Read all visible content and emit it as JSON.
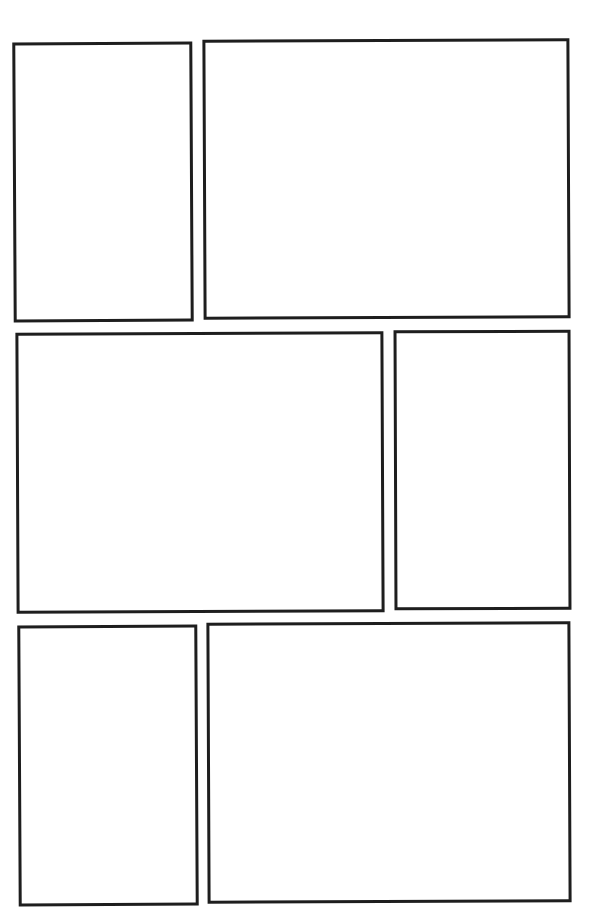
{
  "page": {
    "type": "comic-page-template",
    "background": "#ffffff",
    "border_color": "#1e1e1e",
    "rows": 3,
    "panel_count": 6
  },
  "panels": [
    {
      "id": 1,
      "row": 1,
      "left": 13,
      "top": 42,
      "width": 180,
      "height": 280,
      "rotate": -0.3
    },
    {
      "id": 2,
      "row": 1,
      "left": 203,
      "top": 39,
      "width": 367,
      "height": 280,
      "rotate": -0.25
    },
    {
      "id": 3,
      "row": 2,
      "left": 16,
      "top": 332,
      "width": 368,
      "height": 281,
      "rotate": -0.25
    },
    {
      "id": 4,
      "row": 2,
      "left": 394,
      "top": 330,
      "width": 177,
      "height": 280,
      "rotate": -0.2
    },
    {
      "id": 5,
      "row": 3,
      "left": 18,
      "top": 625,
      "width": 180,
      "height": 281,
      "rotate": -0.3
    },
    {
      "id": 6,
      "row": 3,
      "left": 207,
      "top": 622,
      "width": 364,
      "height": 281,
      "rotate": -0.25
    }
  ]
}
